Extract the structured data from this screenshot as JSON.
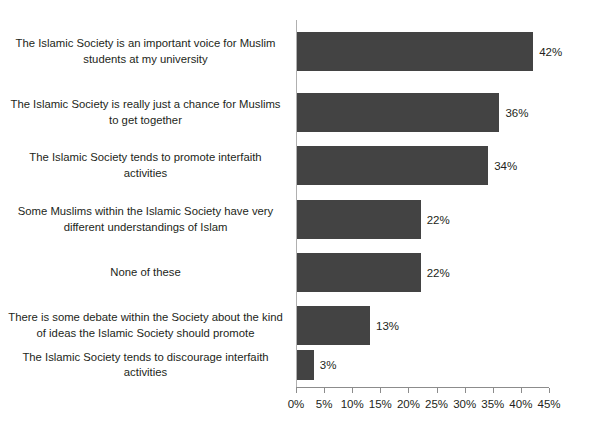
{
  "chart_data": {
    "type": "bar",
    "orientation": "horizontal",
    "title": "",
    "xlabel": "",
    "ylabel": "",
    "xlim": [
      0,
      45
    ],
    "xticks": [
      "0%",
      "5%",
      "10%",
      "15%",
      "20%",
      "25%",
      "30%",
      "35%",
      "40%",
      "45%"
    ],
    "xtick_values": [
      0,
      5,
      10,
      15,
      20,
      25,
      30,
      35,
      40,
      45
    ],
    "grid": false,
    "legend": false,
    "bar_color": "#434343",
    "axis_color": "#8c8c8c",
    "categories": [
      "The Islamic Society is an important voice for Muslim students at my university",
      "The Islamic Society is really just a chance for Muslims to get together",
      "The Islamic Society tends to promote interfaith activities",
      "Some Muslims within the Islamic Society have very different understandings of Islam",
      "None of these",
      "There is some debate within the Society about the kind of ideas the Islamic Society should promote",
      "The Islamic Society tends to discourage interfaith activities"
    ],
    "values": [
      42,
      36,
      34,
      22,
      22,
      13,
      3
    ],
    "data_labels": [
      "42%",
      "36%",
      "34%",
      "22%",
      "22%",
      "13%",
      "3%"
    ]
  }
}
